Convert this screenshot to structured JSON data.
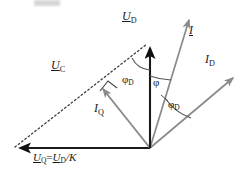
{
  "figure": {
    "width": 252,
    "height": 176,
    "background": "#ffffff"
  },
  "labels": {
    "u_d": {
      "symbol": "U",
      "subscript": "D",
      "text": "U_D"
    },
    "u_c": {
      "symbol": "U",
      "subscript": "C",
      "text": "U_C"
    },
    "u_q_equation": {
      "text": "U_Q = U_D /K",
      "lhs_symbol": "U",
      "lhs_subscript": "Q",
      "operator": "=",
      "rhs_symbol": "U",
      "rhs_subscript": "D",
      "divider": "/K"
    },
    "i": {
      "symbol": "I",
      "subscript": "",
      "text": "I"
    },
    "i_d": {
      "symbol": "I",
      "subscript": "D",
      "text": "I_D"
    },
    "i_q": {
      "symbol": "I",
      "subscript": "Q",
      "text": "I_Q"
    },
    "phi_d_top": {
      "symbol": "φ",
      "subscript": "D",
      "text": "φ_D"
    },
    "phi": {
      "symbol": "φ",
      "subscript": "",
      "text": "φ"
    },
    "phi_d_bottom": {
      "symbol": "φ",
      "subscript": "D",
      "text": "φ_D"
    }
  },
  "geometry": {
    "origin": {
      "x": 150,
      "y": 148
    },
    "vectors": [
      {
        "name": "U_D",
        "from": [
          150,
          148
        ],
        "to": [
          150,
          42
        ],
        "style": "solid-thick-black",
        "color": "#1a1a1a"
      },
      {
        "name": "U_Q",
        "from": [
          150,
          148
        ],
        "to": [
          14,
          148
        ],
        "style": "solid-thick-black",
        "color": "#1a1a1a"
      },
      {
        "name": "U_C",
        "from": [
          14,
          148
        ],
        "to": [
          150,
          42
        ],
        "style": "dotted",
        "color": "#3c3c3c"
      },
      {
        "name": "I_Q",
        "from": [
          150,
          148
        ],
        "to": [
          100,
          85
        ],
        "style": "solid-gray",
        "color": "#8a8a8a"
      },
      {
        "name": "I",
        "from": [
          150,
          148
        ],
        "to": [
          191,
          14
        ],
        "style": "solid-gray",
        "color": "#8a8a8a"
      },
      {
        "name": "I_D",
        "from": [
          150,
          148
        ],
        "to": [
          237,
          74
        ],
        "style": "solid-gray",
        "color": "#8a8a8a"
      }
    ],
    "angle_arcs": [
      {
        "name": "phi_D_top",
        "vertex": [
          150,
          42
        ],
        "between": [
          "U_D",
          "U_C"
        ],
        "radius": 28
      },
      {
        "name": "phi",
        "vertex": [
          150,
          148
        ],
        "between": [
          "U_D",
          "I"
        ],
        "radius": 72
      },
      {
        "name": "phi_D_bottom",
        "vertex": [
          150,
          148
        ],
        "between": [
          "I",
          "I_D"
        ],
        "radius": 52
      }
    ],
    "right_angle_marker": {
      "at": [
        100,
        85
      ],
      "between": [
        "I_Q",
        "U_C"
      ],
      "size": 10
    }
  },
  "colors": {
    "ink_black": "#1a1a1a",
    "gray_vector": "#8a8a8a",
    "dotted_line": "#3c3c3c",
    "arc_line": "#555555",
    "background": "#ffffff"
  }
}
